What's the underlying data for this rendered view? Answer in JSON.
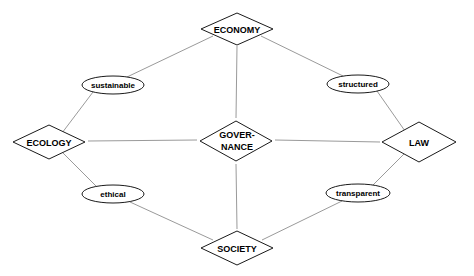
{
  "colors": {
    "background": "#ffffff",
    "shape_stroke": "#1a1a1a",
    "edge_stroke": "#9a9a9a",
    "text": "#000000"
  },
  "nodes": {
    "economy": {
      "label": "ECONOMY",
      "shape": "diamond",
      "cx": 237,
      "cy": 29,
      "w": 72,
      "h": 32
    },
    "ecology": {
      "label": "ECOLOGY",
      "shape": "diamond",
      "cx": 49,
      "cy": 142,
      "w": 72,
      "h": 34
    },
    "governance": {
      "label_line1": "GOVER-",
      "label_line2": "NANCE",
      "shape": "diamond",
      "cx": 236,
      "cy": 141,
      "w": 72,
      "h": 40
    },
    "law": {
      "label": "LAW",
      "shape": "diamond",
      "cx": 419,
      "cy": 142,
      "w": 74,
      "h": 40
    },
    "society": {
      "label": "SOCIETY",
      "shape": "diamond",
      "cx": 237,
      "cy": 248,
      "w": 72,
      "h": 34
    }
  },
  "edge_labels": {
    "sustainable": {
      "label": "sustainable",
      "shape": "ellipse",
      "cx": 113,
      "cy": 85,
      "rx": 31,
      "ry": 9
    },
    "structured": {
      "label": "structured",
      "shape": "ellipse",
      "cx": 357,
      "cy": 84,
      "rx": 31,
      "ry": 9
    },
    "ethical": {
      "label": "ethical",
      "shape": "ellipse",
      "cx": 114,
      "cy": 194,
      "rx": 31,
      "ry": 9
    },
    "transparent": {
      "label": "transparent",
      "shape": "ellipse",
      "cx": 357,
      "cy": 193,
      "rx": 32,
      "ry": 9
    }
  },
  "edges": [
    {
      "from": "ecology",
      "to": "economy",
      "via": "sustainable"
    },
    {
      "from": "economy",
      "to": "law",
      "via": "structured"
    },
    {
      "from": "ecology",
      "to": "society",
      "via": "ethical"
    },
    {
      "from": "society",
      "to": "law",
      "via": "transparent"
    },
    {
      "from": "economy",
      "to": "governance"
    },
    {
      "from": "governance",
      "to": "society"
    },
    {
      "from": "ecology",
      "to": "governance"
    },
    {
      "from": "governance",
      "to": "law"
    }
  ]
}
